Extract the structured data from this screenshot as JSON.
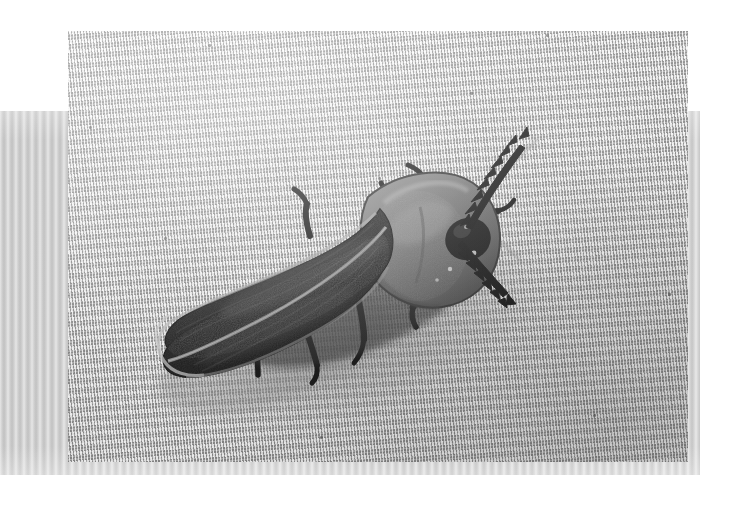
{
  "page": {
    "background_color": "#ffffff",
    "width": 736,
    "height": 505,
    "caption": "Black-and-white photograph of a beetle resting on woven fabric"
  },
  "scan_band": {
    "name": "scanner-artifact-band",
    "color": "#c9c9c9",
    "x": 0,
    "y": 111,
    "width": 700,
    "height": 364,
    "description": "Light gray vertically striped band behind the photograph"
  },
  "photo": {
    "x": 68,
    "y": 31,
    "width": 620,
    "height": 431,
    "medium": "monochrome photograph",
    "background": {
      "name": "woven-fabric",
      "description": "Fine plain-weave cloth with crosshatch texture, rotated about six degrees",
      "base_color": "#cdcdcd",
      "highlight_color": "#f2f2f2",
      "shadow_color": "#8a8a8a"
    },
    "subject": {
      "name": "beetle",
      "common_name": "Beetle",
      "orientation": "head toward upper right, abdomen toward lower left",
      "body_color": "#141414",
      "pronotum_color": "#6e6e6e",
      "highlight_color": "#b4b4b4",
      "parts": [
        {
          "name": "elytra",
          "label": "Elytra (wing covers)",
          "color": "#121212",
          "note": "Two dark ribbed wing covers with a central suture"
        },
        {
          "name": "suture",
          "label": "Elytral suture",
          "color": "#8d8d8d",
          "note": "Pale line dividing the wing covers"
        },
        {
          "name": "pronotum",
          "label": "Pronotum",
          "color": "#767676",
          "note": "Broad semicircular shield covering the head"
        },
        {
          "name": "head",
          "label": "Head",
          "color": "#111111"
        },
        {
          "name": "antenna-upper",
          "label": "Upper serrate antenna",
          "color": "#0d0d0d",
          "note": "Saw-toothed, angled up and to the right"
        },
        {
          "name": "antenna-lower",
          "label": "Lower serrate antenna",
          "color": "#0d0d0d",
          "note": "Saw-toothed, angled down and to the right"
        },
        {
          "name": "legs",
          "label": "Legs",
          "color": "#101010",
          "count": 6
        },
        {
          "name": "cast-shadow",
          "label": "Cast shadow on fabric",
          "color": "#9a9a9a"
        }
      ]
    }
  },
  "flecks": [
    {
      "x": 140,
      "y": 13
    },
    {
      "x": 478,
      "y": 3
    },
    {
      "x": 21,
      "y": 95
    },
    {
      "x": 310,
      "y": 146
    },
    {
      "x": 525,
      "y": 383
    },
    {
      "x": 252,
      "y": 405
    },
    {
      "x": 600,
      "y": 262
    },
    {
      "x": 96,
      "y": 206
    },
    {
      "x": 402,
      "y": 61
    }
  ]
}
